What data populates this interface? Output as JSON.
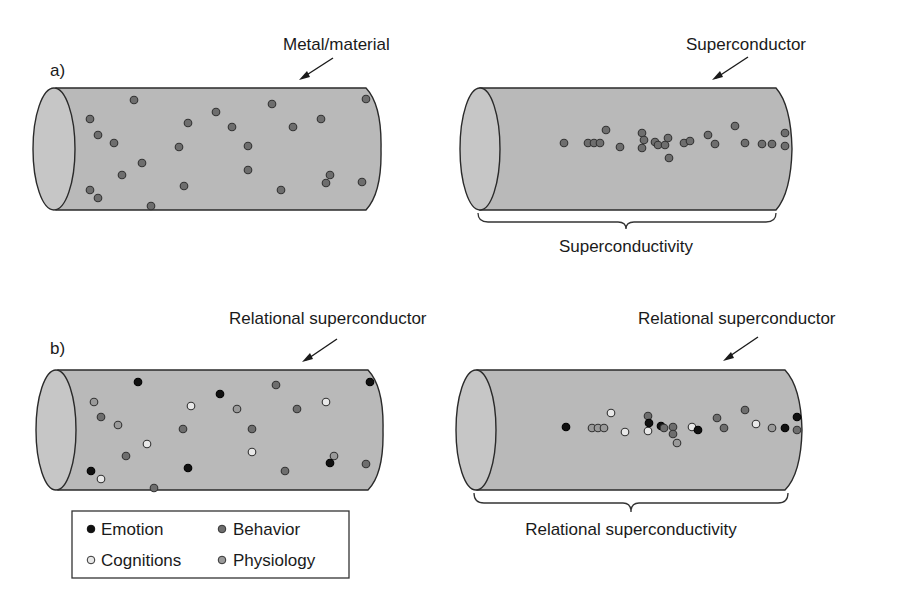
{
  "panels": {
    "a": {
      "label": "a)",
      "left": {
        "title": "Metal/material",
        "dots": [
          [
            134,
            100,
            "B"
          ],
          [
            90,
            119,
            "B"
          ],
          [
            98,
            135,
            "B"
          ],
          [
            114,
            143,
            "B"
          ],
          [
            188,
            123,
            "B"
          ],
          [
            216,
            112,
            "B"
          ],
          [
            232,
            127,
            "B"
          ],
          [
            179,
            147,
            "B"
          ],
          [
            142,
            163,
            "B"
          ],
          [
            122,
            175,
            "B"
          ],
          [
            90,
            190,
            "B"
          ],
          [
            98,
            198,
            "B"
          ],
          [
            151,
            206,
            "B"
          ],
          [
            184,
            186,
            "B"
          ],
          [
            248,
            146,
            "B"
          ],
          [
            248,
            170,
            "B"
          ],
          [
            272,
            104,
            "B"
          ],
          [
            293,
            127,
            "B"
          ],
          [
            321,
            119,
            "B"
          ],
          [
            281,
            190,
            "B"
          ],
          [
            330,
            175,
            "B"
          ],
          [
            326,
            183,
            "B"
          ],
          [
            362,
            182,
            "B"
          ],
          [
            366,
            99,
            "B"
          ]
        ]
      },
      "right": {
        "title": "Superconductor",
        "caption": "Superconductivity",
        "dots": [
          [
            564,
            143,
            "B"
          ],
          [
            588,
            143,
            "B"
          ],
          [
            594,
            143,
            "B"
          ],
          [
            600,
            143,
            "B"
          ],
          [
            606,
            130,
            "B"
          ],
          [
            620,
            147,
            "B"
          ],
          [
            642,
            133,
            "B"
          ],
          [
            644,
            140,
            "B"
          ],
          [
            642,
            148,
            "B"
          ],
          [
            655,
            142,
            "B"
          ],
          [
            658,
            145,
            "B"
          ],
          [
            665,
            145,
            "B"
          ],
          [
            668,
            138,
            "B"
          ],
          [
            669,
            158,
            "B"
          ],
          [
            684,
            143,
            "B"
          ],
          [
            690,
            141,
            "B"
          ],
          [
            708,
            135,
            "B"
          ],
          [
            715,
            144,
            "B"
          ],
          [
            735,
            126,
            "B"
          ],
          [
            745,
            143,
            "B"
          ],
          [
            762,
            144,
            "B"
          ],
          [
            772,
            144,
            "B"
          ],
          [
            785,
            133,
            "B"
          ],
          [
            785,
            146,
            "B"
          ]
        ]
      }
    },
    "b": {
      "label": "b)",
      "left": {
        "title": "Relational superconductor",
        "dots": [
          [
            138,
            382,
            "E"
          ],
          [
            94,
            402,
            "P"
          ],
          [
            101,
            417,
            "B"
          ],
          [
            118,
            425,
            "P"
          ],
          [
            147,
            444,
            "C"
          ],
          [
            126,
            456,
            "B"
          ],
          [
            91,
            471,
            "E"
          ],
          [
            101,
            479,
            "C"
          ],
          [
            154,
            488,
            "B"
          ],
          [
            191,
            406,
            "C"
          ],
          [
            183,
            429,
            "B"
          ],
          [
            188,
            468,
            "E"
          ],
          [
            220,
            394,
            "E"
          ],
          [
            237,
            409,
            "P"
          ],
          [
            252,
            429,
            "B"
          ],
          [
            252,
            452,
            "C"
          ],
          [
            285,
            471,
            "B"
          ],
          [
            276,
            385,
            "B"
          ],
          [
            297,
            409,
            "B"
          ],
          [
            326,
            402,
            "C"
          ],
          [
            334,
            456,
            "P"
          ],
          [
            330,
            463,
            "E"
          ],
          [
            366,
            464,
            "B"
          ],
          [
            370,
            382,
            "E"
          ]
        ]
      },
      "right": {
        "title": "Relational superconductor",
        "caption": "Relational superconductivity",
        "dots": [
          [
            566,
            427,
            "E"
          ],
          [
            592,
            428,
            "P"
          ],
          [
            598,
            428,
            "P"
          ],
          [
            604,
            428,
            "P"
          ],
          [
            611,
            413,
            "C"
          ],
          [
            625,
            432,
            "C"
          ],
          [
            648,
            416,
            "B"
          ],
          [
            648,
            431,
            "C"
          ],
          [
            649,
            423,
            "E"
          ],
          [
            661,
            426,
            "E"
          ],
          [
            664,
            428,
            "B"
          ],
          [
            673,
            427,
            "B"
          ],
          [
            673,
            434,
            "B"
          ],
          [
            677,
            443,
            "P"
          ],
          [
            692,
            427,
            "C"
          ],
          [
            698,
            430,
            "E"
          ],
          [
            717,
            418,
            "B"
          ],
          [
            724,
            428,
            "B"
          ],
          [
            745,
            410,
            "B"
          ],
          [
            756,
            424,
            "C"
          ],
          [
            772,
            428,
            "P"
          ],
          [
            785,
            428,
            "E"
          ],
          [
            797,
            417,
            "E"
          ],
          [
            797,
            430,
            "B"
          ]
        ]
      }
    }
  },
  "legend": {
    "items": [
      {
        "key": "E",
        "label": "Emotion",
        "color": "#111111"
      },
      {
        "key": "B",
        "label": "Behavior",
        "color": "#6e6e6e"
      },
      {
        "key": "C",
        "label": "Cognitions",
        "color": "#e8e8e8"
      },
      {
        "key": "P",
        "label": "Physiology",
        "color": "#9a9a9a"
      }
    ]
  }
}
